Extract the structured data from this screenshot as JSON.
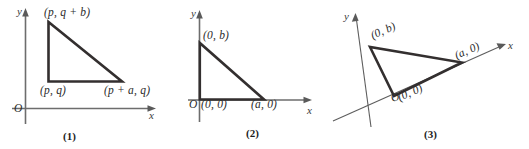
{
  "figure": {
    "background_color": "#ffffff",
    "axis_color": "#6d6d6d",
    "triangle_color": "#332f2f",
    "text_color": "#2b2b2b",
    "panels": [
      {
        "caption": "(1)",
        "axis_labels": {
          "x": "x",
          "y": "y",
          "origin": "O"
        },
        "vertex_labels": {
          "top": "(p, q + b)",
          "bottom_left": "(p, q)",
          "bottom_right": "(p + a, q)"
        }
      },
      {
        "caption": "(2)",
        "axis_labels": {
          "x": "x",
          "y": "y",
          "origin": "O"
        },
        "vertex_labels": {
          "top": "(0, b)",
          "bottom_left": "(0, 0)",
          "bottom_right": "(a, 0)"
        }
      },
      {
        "caption": "(3)",
        "axis_labels": {
          "x": "x",
          "y": "y",
          "origin": "O"
        },
        "vertex_labels": {
          "top": "(0, b)",
          "bottom_left": "(0, 0)",
          "bottom_right": "(a, 0)"
        }
      }
    ]
  }
}
